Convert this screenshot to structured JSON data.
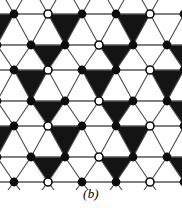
{
  "figure": {
    "caption": "(b)",
    "type": "lattice-diagram",
    "width": 182,
    "height": 208
  },
  "colors": {
    "background": "#ffffff",
    "ink": "#1a1a1a",
    "fill_triangle": "#141414",
    "node_filled": "#0d0d0d",
    "node_open_fill": "#ffffff",
    "node_open_stroke": "#0d0d0d",
    "edge_thin": "#4a4a4a",
    "edge_thick": "#2b2b2b"
  },
  "lattice": {
    "rows_y": [
      14,
      45,
      70,
      101,
      126,
      157,
      182
    ],
    "column_spacing": 34,
    "row_offsets": [
      14,
      31,
      14,
      31,
      14,
      31,
      14
    ],
    "node_radius_filled": 4.2,
    "node_radius_open": 4.0,
    "rows": [
      {
        "index": 0,
        "y": 14,
        "x_start": 14,
        "nodes": [
          "filled",
          "open",
          "filled",
          "filled",
          "open",
          "filled"
        ]
      },
      {
        "index": 1,
        "y": 45,
        "x_start": -3,
        "nodes": [
          "filled",
          "filled",
          "open",
          "filled",
          "filled",
          "open"
        ]
      },
      {
        "index": 2,
        "y": 70,
        "x_start": 14,
        "nodes": [
          "filled",
          "open",
          "filled",
          "filled",
          "open",
          "filled"
        ]
      },
      {
        "index": 3,
        "y": 101,
        "x_start": -3,
        "nodes": [
          "filled",
          "filled",
          "open",
          "filled",
          "filled",
          "open"
        ]
      },
      {
        "index": 4,
        "y": 126,
        "x_start": 14,
        "nodes": [
          "filled",
          "open",
          "filled",
          "filled",
          "open",
          "filled"
        ]
      },
      {
        "index": 5,
        "y": 157,
        "x_start": -3,
        "nodes": [
          "filled",
          "filled",
          "open",
          "filled",
          "filled",
          "open"
        ]
      },
      {
        "index": 6,
        "y": 182,
        "x_start": 14,
        "nodes": [
          "filled",
          "open",
          "filled",
          "filled",
          "open",
          "filled"
        ]
      }
    ],
    "shaded_triangles": [
      {
        "band": 0,
        "apex_y": 14,
        "base_y": 45,
        "left_x": 48,
        "right_x": 82,
        "apex_x": 65,
        "orientation": "down"
      },
      {
        "band": 0,
        "apex_y": 14,
        "base_y": 45,
        "left_x": 116,
        "right_x": 150,
        "apex_x": 133,
        "orientation": "down"
      },
      {
        "band": 0,
        "apex_y": 14,
        "base_y": 45,
        "left_x": -20,
        "right_x": 14,
        "apex_x": -3,
        "orientation": "down"
      },
      {
        "band": 1,
        "apex_y": 70,
        "base_y": 45,
        "left_x": 31,
        "right_x": 65,
        "apex_x": 48,
        "orientation": "up"
      },
      {
        "band": 1,
        "apex_y": 70,
        "base_y": 45,
        "left_x": 99,
        "right_x": 133,
        "apex_x": 116,
        "orientation": "up"
      },
      {
        "band": 1,
        "apex_y": 70,
        "base_y": 45,
        "left_x": 167,
        "right_x": 201,
        "apex_x": 184,
        "orientation": "up"
      },
      {
        "band": 2,
        "apex_y": 70,
        "base_y": 101,
        "left_x": 82,
        "right_x": 116,
        "apex_x": 99,
        "orientation": "down"
      },
      {
        "band": 2,
        "apex_y": 70,
        "base_y": 101,
        "left_x": 14,
        "right_x": 48,
        "apex_x": 31,
        "orientation": "down"
      },
      {
        "band": 2,
        "apex_y": 70,
        "base_y": 101,
        "left_x": 150,
        "right_x": 184,
        "apex_x": 167,
        "orientation": "down"
      },
      {
        "band": 3,
        "apex_y": 126,
        "base_y": 101,
        "left_x": 31,
        "right_x": 65,
        "apex_x": 48,
        "orientation": "up"
      },
      {
        "band": 3,
        "apex_y": 126,
        "base_y": 101,
        "left_x": 99,
        "right_x": 133,
        "apex_x": 116,
        "orientation": "up"
      },
      {
        "band": 4,
        "apex_y": 126,
        "base_y": 157,
        "left_x": 48,
        "right_x": 82,
        "apex_x": 65,
        "orientation": "down"
      },
      {
        "band": 4,
        "apex_y": 126,
        "base_y": 157,
        "left_x": 116,
        "right_x": 150,
        "apex_x": 133,
        "orientation": "down"
      },
      {
        "band": 4,
        "apex_y": 126,
        "base_y": 157,
        "left_x": -20,
        "right_x": 14,
        "apex_x": -3,
        "orientation": "down"
      },
      {
        "band": 5,
        "apex_y": 182,
        "base_y": 157,
        "left_x": 31,
        "right_x": 65,
        "apex_x": 48,
        "orientation": "up"
      },
      {
        "band": 5,
        "apex_y": 182,
        "base_y": 157,
        "left_x": 99,
        "right_x": 133,
        "apex_x": 116,
        "orientation": "up"
      },
      {
        "band": 5,
        "apex_y": 182,
        "base_y": 157,
        "left_x": 167,
        "right_x": 201,
        "apex_x": 184,
        "orientation": "up"
      }
    ]
  }
}
